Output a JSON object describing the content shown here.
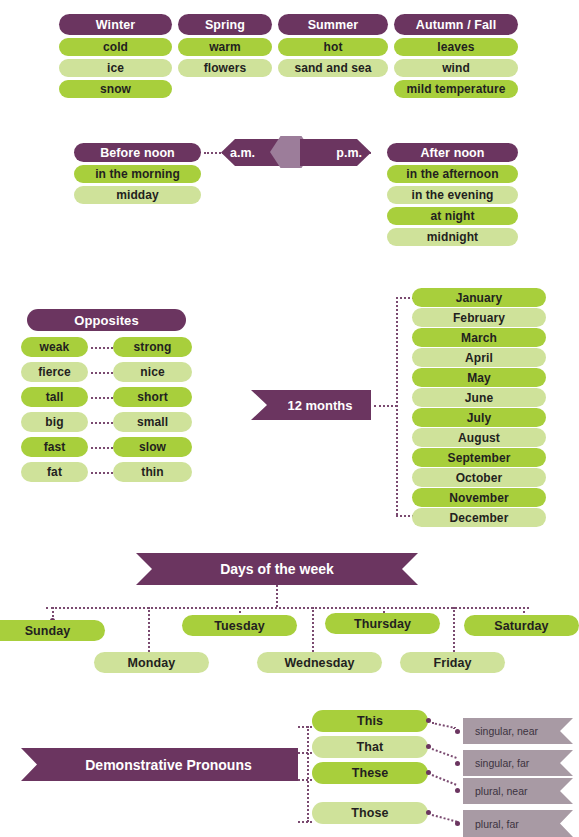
{
  "theme": {
    "purple": "#6b3560",
    "green_dark": "#a8cf3c",
    "green_light": "#cfe29a",
    "grey_purple": "#a89aa4",
    "hex_mid": "#9c7d9a",
    "background": "#ffffff",
    "text_dark": "#231f20",
    "text_light": "#ffffff"
  },
  "seasons": {
    "columns": [
      {
        "title": "Winter",
        "items": [
          "cold",
          "ice",
          "snow"
        ]
      },
      {
        "title": "Spring",
        "items": [
          "warm",
          "flowers"
        ]
      },
      {
        "title": "Summer",
        "items": [
          "hot",
          "sand and sea"
        ]
      },
      {
        "title": "Autumn / Fall",
        "items": [
          "leaves",
          "wind",
          "mild temperature"
        ]
      }
    ]
  },
  "time_of_day": {
    "left": {
      "title": "Before noon",
      "items": [
        "in the morning",
        "midday"
      ]
    },
    "connector_left": "a.m.",
    "connector_right": "p.m.",
    "right": {
      "title": "After noon",
      "items": [
        "in the afternoon",
        "in the evening",
        "at night",
        "midnight"
      ]
    }
  },
  "opposites": {
    "title": "Opposites",
    "pairs": [
      {
        "left": "weak",
        "right": "strong"
      },
      {
        "left": "fierce",
        "right": "nice"
      },
      {
        "left": "tall",
        "right": "short"
      },
      {
        "left": "big",
        "right": "small"
      },
      {
        "left": "fast",
        "right": "slow"
      },
      {
        "left": "fat",
        "right": "thin"
      }
    ]
  },
  "months": {
    "title": "12 months",
    "items": [
      "January",
      "February",
      "March",
      "April",
      "May",
      "June",
      "July",
      "August",
      "September",
      "October",
      "November",
      "December"
    ]
  },
  "days": {
    "title": "Days of the week",
    "items": [
      "Sunday",
      "Monday",
      "Tuesday",
      "Wednesday",
      "Thursday",
      "Friday",
      "Saturday"
    ]
  },
  "demonstratives": {
    "title": "Demonstrative Pronouns",
    "items": [
      {
        "pronoun": "This",
        "note": "singular, near"
      },
      {
        "pronoun": "That",
        "note": "singular, far"
      },
      {
        "pronoun": "These",
        "note": "plural, near"
      },
      {
        "pronoun": "Those",
        "note": "plural, far"
      }
    ]
  }
}
